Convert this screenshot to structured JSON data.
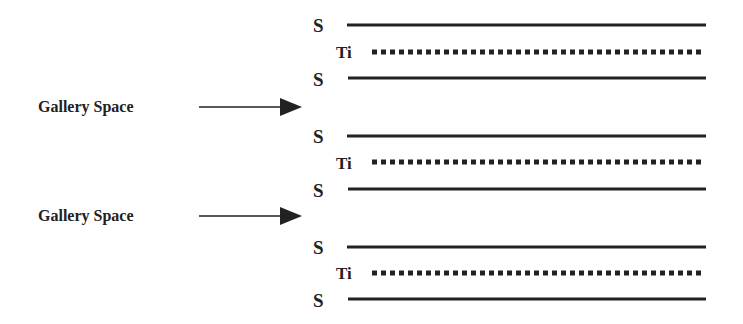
{
  "diagram": {
    "groups": [
      {
        "top": "S",
        "middle": "Ti",
        "bottom": "S"
      },
      {
        "top": "S",
        "middle": "Ti",
        "bottom": "S"
      },
      {
        "top": "S",
        "middle": "Ti",
        "bottom": "S"
      }
    ],
    "gaps": [
      {
        "label": "Gallery Space"
      },
      {
        "label": "Gallery Space"
      }
    ],
    "line_color": "#222222"
  }
}
